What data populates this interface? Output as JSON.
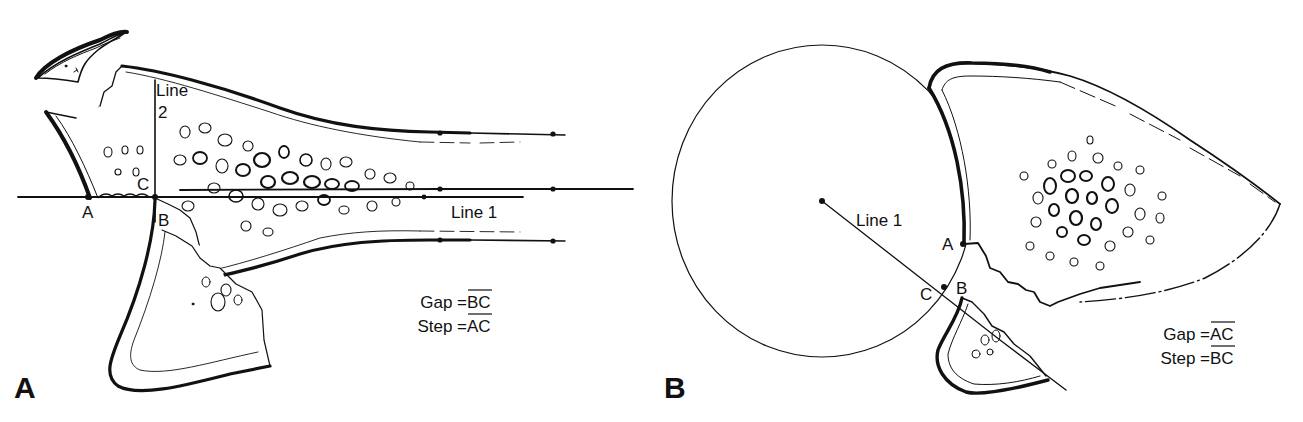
{
  "figure": {
    "panels": [
      {
        "id": "A",
        "label": "A",
        "line_labels": {
          "line1": "Line 1",
          "line2_a": "Line",
          "line2_b": "2"
        },
        "points": {
          "A": "A",
          "B": "B",
          "C": "C"
        },
        "equations": {
          "gap": "Gap = ",
          "gap_seg": "BC",
          "step": "Step = ",
          "step_seg": "AC"
        }
      },
      {
        "id": "B",
        "label": "B",
        "line_labels": {
          "line1": "Line 1"
        },
        "points": {
          "A": "A",
          "B": "B",
          "C": "C"
        },
        "equations": {
          "gap": "Gap = ",
          "gap_seg": "AC",
          "step": "Step = ",
          "step_seg": "BC"
        }
      }
    ],
    "colors": {
      "ink": "#111111",
      "background": "#ffffff"
    }
  }
}
